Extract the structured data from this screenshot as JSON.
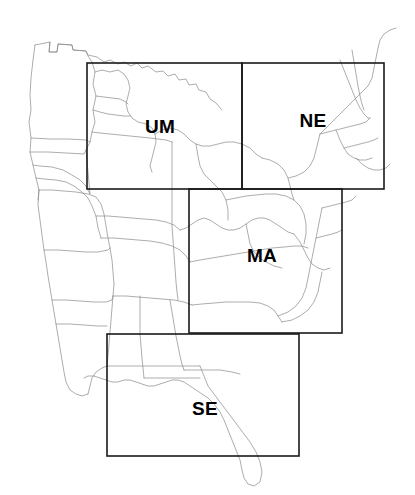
{
  "figure": {
    "type": "region-map",
    "background_color": "#ffffff",
    "state_outline_color": "#8a8a8a",
    "box_color": "#1a1a1a",
    "label_color": "#000000",
    "width": 415,
    "height": 495
  },
  "regions": [
    {
      "code": "UM",
      "label": "UM",
      "box": {
        "x": 87,
        "y": 63,
        "width": 155,
        "height": 126
      },
      "label_pos": {
        "x": 160,
        "y": 128
      }
    },
    {
      "code": "NE",
      "label": "NE",
      "box": {
        "x": 242,
        "y": 63,
        "width": 142,
        "height": 126
      },
      "label_pos": {
        "x": 313,
        "y": 122
      }
    },
    {
      "code": "MA",
      "label": "MA",
      "box": {
        "x": 189,
        "y": 189,
        "width": 153,
        "height": 144
      },
      "label_pos": {
        "x": 262,
        "y": 257
      }
    },
    {
      "code": "SE",
      "label": "SE",
      "box": {
        "x": 107,
        "y": 334,
        "width": 192,
        "height": 122
      },
      "label_pos": {
        "x": 205,
        "y": 410
      }
    }
  ],
  "map_outlines": {
    "national_border": "M 50 42 L 49 52 L 57 52 L 58 44 L 72 45 L 73 50 L 86 51 L 88 55 L 97 57 L 104 62 L 110 60 L 118 64 L 124 62 L 131 66 L 137 63 L 142 68 L 148 66 L 156 72 L 163 71 L 168 76 L 175 74 L 179 80 L 186 79 L 189 85 L 196 84 L 199 90 L 206 92 L 210 99 L 216 103 L 222 110",
    "states": [
      "M 35 45 L 33 60 L 31 78 L 30 95 L 31 110 L 29 122 L 31 138 L 30 152 L 33 165 L 36 178 L 39 190 L 38 200",
      "M 35 45 L 50 42 L 49 52 L 57 52 L 58 44 L 72 45 L 73 50 L 86 51 L 88 56 L 92 62 L 95 72 L 93 84 L 96 96 L 93 110 L 95 122 L 92 132 L 90 142 L 86 150",
      "M 31 138 L 50 139 L 68 139 L 86 140 L 90 142",
      "M 30 152 L 48 152 L 66 153 L 84 154 L 86 150",
      "M 33 165 L 40 166 L 52 167 L 63 170 L 72 175 L 80 180 L 86 186 L 90 194 L 86 150",
      "M 36 178 L 44 179 L 56 180 L 66 182 L 74 186 L 82 192 L 88 198 L 92 206 L 96 216 L 98 228 L 101 238",
      "M 39 190 L 38 205 L 40 220 L 42 235 L 44 250 L 46 262 L 48 276 L 50 288 L 52 300 L 54 312 L 56 324 L 58 336 L 60 348 L 62 360 L 64 372 L 66 382 L 70 390 L 76 394 L 82 396 L 88 394",
      "M 39 190 L 52 190 L 64 191 L 76 192 L 88 194 L 96 197 L 101 204 L 104 214 L 106 226 L 108 238 L 110 248",
      "M 44 250 L 58 250 L 72 251 L 86 252 L 98 252 L 108 250 L 110 248",
      "M 52 300 L 66 300 L 80 301 L 94 302 L 106 302 L 112 300 L 113 296",
      "M 56 324 L 70 324 L 84 325 L 98 326 L 107 326",
      "M 88 394 L 90 386 L 92 378 L 96 372 L 102 368 L 107 366",
      "M 95 72 L 102 70 L 110 72 L 118 70 L 124 74 L 128 80 L 130 88 L 128 96 L 126 104 L 128 112 L 132 118 L 138 122 L 146 124 L 152 128 L 155 134 L 156 142 L 154 150 L 152 158 L 150 166 L 152 172",
      "M 96 96 L 104 97 L 112 98 L 120 99 L 126 102 L 128 104",
      "M 93 110 L 100 112 L 108 114 L 116 115 L 124 116 L 130 116",
      "M 92 132 L 100 133 L 110 134 L 120 135 L 130 136 L 140 137 L 150 138 L 158 139 L 166 140 L 172 142",
      "M 96 216 L 108 216 L 120 217 L 132 218 L 144 219 L 156 220 L 166 222 L 174 225 L 180 230",
      "M 101 238 L 114 238 L 126 239 L 138 240 L 150 241 L 162 243 L 172 246 L 180 250 L 186 256 L 190 262",
      "M 110 248 L 112 260 L 113 272 L 114 284 L 113 296 L 112 308 L 111 320 L 110 332 L 109 344 L 108 356 L 107 366",
      "M 113 296 L 126 296 L 138 297 L 150 298 L 162 299 L 174 300 L 184 302 L 192 305",
      "M 140 296 L 140 310 L 140 322 L 140 334 L 141 346 L 142 358 L 143 368 L 144 378",
      "M 170 300 L 172 312 L 174 324 L 176 336 L 178 346 L 180 356 L 182 364 L 184 370",
      "M 155 134 L 162 130 L 170 128 L 178 130 L 184 134 L 190 140 L 196 144 L 202 146 L 210 146 L 218 144 L 226 142 L 234 142 L 242 144 L 250 148 L 256 154 L 262 158",
      "M 172 142 L 172 156 L 172 170 L 172 184 L 172 198 L 172 212 L 172 226 L 173 240 L 174 254 L 175 268 L 176 282 L 177 292 L 178 300",
      "M 180 230 L 186 228 L 192 224 L 198 220 L 204 218 L 210 220 L 216 224 L 222 228 L 228 230 L 234 230 L 240 228 L 246 224 L 252 220 L 258 218 L 264 218 L 270 220 L 276 224 L 282 228 L 288 232 L 294 234",
      "M 190 262 L 200 260 L 212 258 L 224 256 L 236 254 L 248 252 L 260 250 L 272 248 L 284 247 L 294 246 L 302 246 L 308 248",
      "M 192 305 L 202 304 L 214 303 L 226 302 L 238 302 L 250 302 L 260 303 L 268 306 L 274 310 L 278 316 L 282 322",
      "M 196 144 L 198 156 L 200 166 L 204 174 L 210 180 L 216 186 L 222 192 L 226 200 L 228 210 L 228 220",
      "M 226 200 L 236 198 L 246 196 L 256 195 L 266 194 L 276 194 L 286 196 L 294 200 L 300 206 L 304 214 L 306 224 L 306 234 L 304 244",
      "M 246 224 L 248 234 L 250 244 L 254 252 L 260 258 L 266 262 L 274 266 L 282 268",
      "M 278 316 L 288 312 L 296 306 L 302 298 L 306 288 L 308 278 L 310 268 L 312 258 L 314 248 L 316 238 L 318 228 L 320 218 L 322 208",
      "M 282 322 L 292 320 L 300 316 L 308 310 L 314 302 L 318 292 L 320 282 L 322 272",
      "M 262 158 L 270 160 L 278 164 L 284 170 L 288 178 L 290 186 L 292 194 L 294 200",
      "M 288 178 L 296 176 L 304 172 L 310 166 L 314 158 L 316 150 L 318 142 L 320 134",
      "M 294 234 L 300 242 L 304 250 L 308 258 L 312 264 L 318 268 L 324 270 L 330 268",
      "M 320 134 L 326 128 L 332 122 L 338 116 L 344 110 L 350 104 L 356 98 L 362 92 L 368 86 L 372 78 L 374 68 L 376 58 L 378 48 L 380 40 L 384 34 L 390 30 L 396 28",
      "M 320 134 L 328 132 L 336 130 L 344 128 L 352 126 L 360 124 L 366 122 L 370 118",
      "M 340 60 L 344 70 L 348 80 L 352 90 L 356 100 L 360 108 L 364 114 L 368 118 L 370 118",
      "M 352 50 L 354 62 L 356 74 L 358 86 L 360 96 L 362 104 L 364 110",
      "M 336 130 L 340 140 L 344 148 L 348 154 L 354 158 L 360 160 L 366 160 L 372 158",
      "M 344 148 L 352 146 L 360 144 L 368 142 L 374 140 L 378 138",
      "M 356 158 L 362 164 L 368 168 L 374 170 L 380 170 L 386 168 L 390 164",
      "M 322 208 L 330 206 L 338 204 L 346 202 L 352 200 L 356 196",
      "M 316 238 L 324 236 L 332 234 L 338 232 L 342 230",
      "M 107 366 L 120 366 L 134 366 L 148 366 L 162 366 L 176 366 L 190 366 L 200 366",
      "M 144 378 L 156 378 L 168 378 L 180 378 L 192 378 L 200 378",
      "M 184 370 L 196 370 L 208 370 L 220 370 L 232 372 L 240 374",
      "M 200 366 L 204 376 L 208 386 L 214 394 L 220 402 L 226 410 L 232 418 L 238 426 L 244 434 L 250 442 L 256 452 L 260 462 L 262 472 L 260 482 L 254 486 L 248 484 L 244 478 L 242 470 L 240 460 L 236 450 L 232 440 L 228 430 L 224 420 L 220 412 L 214 404 L 208 398 L 202 394 L 196 390 L 190 386 L 184 382 L 178 380 L 172 380 L 166 382 L 160 384 L 154 386 L 148 386 L 142 384 L 136 382 L 130 380 L 124 380 L 118 382 L 112 382 L 106 380 L 100 378 L 94 376 L 88 376 L 84 378"
    ]
  }
}
